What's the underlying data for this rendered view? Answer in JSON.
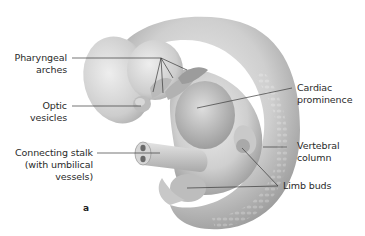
{
  "figure": {
    "panel_letter": "a",
    "labels": {
      "pharyngeal_arches": [
        "Pharyngeal",
        "arches"
      ],
      "optic_vesicles": [
        "Optic",
        "vesicles"
      ],
      "connecting_stalk": [
        "Connecting stalk",
        "(with umbilical",
        "vessels)"
      ],
      "cardiac_prominence": [
        "Cardiac",
        "prominence"
      ],
      "vertebral_column": [
        "Vertebral",
        "column"
      ],
      "limb_buds": [
        "Limb buds"
      ]
    },
    "colors": {
      "background": "#ffffff",
      "text": "#2a2a2a",
      "leader_line": "#3a3a3a",
      "embryo_light": "#e6e6e6",
      "embryo_mid": "#c4c4c4",
      "embryo_dark": "#8a8a8a"
    }
  }
}
